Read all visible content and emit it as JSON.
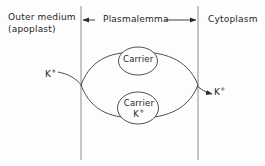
{
  "figure": {
    "background_color": "#fdfdfd",
    "line_color": "#3a3a3a",
    "membrane_color": "#a8a8a8"
  },
  "compartments": {
    "left_label_line1": "Outer medium",
    "left_label_line2": "(apoplast)",
    "middle_label": "Plasmalemma",
    "right_label": "Cytoplasm"
  },
  "ions": {
    "outside_ion": "K",
    "outside_ion_charge": "+",
    "inside_ion": "K",
    "inside_ion_charge": "+"
  },
  "carriers": {
    "free_carrier_label": "Carrier",
    "loaded_carrier_label": "Carrier",
    "loaded_carrier_ion": "K",
    "loaded_carrier_ion_charge": "+"
  },
  "geometry": {
    "membrane_left_x": 81,
    "membrane_right_x": 198,
    "membrane_top_y": 6,
    "membrane_bottom_y": 160,
    "cycle_center_y": 85,
    "cycle_top_y": 56,
    "cycle_bottom_y": 115
  }
}
